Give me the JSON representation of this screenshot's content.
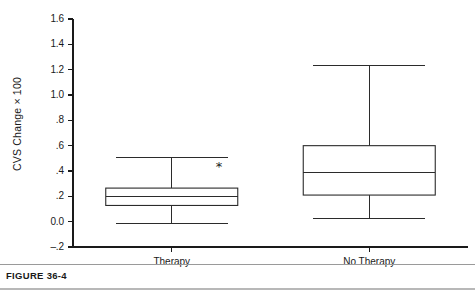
{
  "figure": {
    "caption": "FIGURE 36-4"
  },
  "chart_data": {
    "type": "box",
    "title": "",
    "xlabel": "",
    "ylabel": "CVS Change × 100",
    "ylim": [
      -0.2,
      1.6
    ],
    "ytick_values": [
      1.6,
      1.4,
      1.2,
      1.0,
      0.8,
      0.6,
      0.4,
      0.2,
      0.0,
      -0.2
    ],
    "ytick_labels": [
      "1.6",
      "1.4",
      "1.2",
      "1.0",
      ".8",
      ".6",
      ".4",
      ".2",
      "0.0",
      "–.2"
    ],
    "grid": false,
    "legend": false,
    "categories": [
      "Therapy",
      "No Therapy"
    ],
    "boxes": [
      {
        "label": "Therapy",
        "whisker_low": -0.015,
        "q1": 0.128,
        "median": 0.2,
        "q3": 0.265,
        "whisker_high": 0.51
      },
      {
        "label": "No Therapy",
        "whisker_low": 0.025,
        "q1": 0.21,
        "median": 0.385,
        "q3": 0.6,
        "whisker_high": 1.23
      }
    ],
    "annotations": [
      {
        "text": "*",
        "x_category": "Therapy",
        "y": 0.43
      }
    ]
  }
}
